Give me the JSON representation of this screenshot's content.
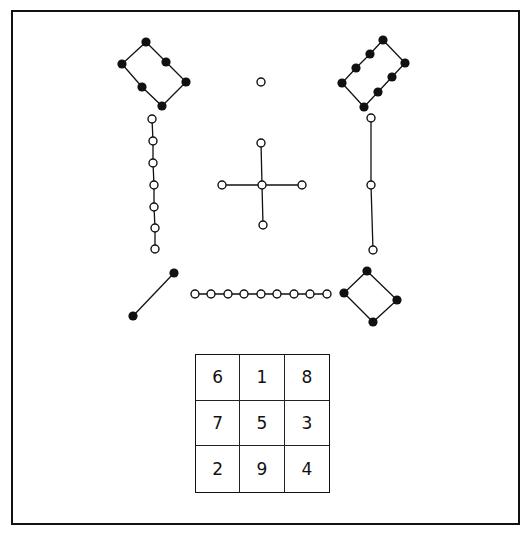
{
  "colors": {
    "ink": "#111111",
    "background": "#ffffff"
  },
  "figures": [
    {
      "name": "filled-loop-6",
      "kind": "closed",
      "fill": "filled",
      "points": [
        [
          146,
          42
        ],
        [
          166,
          62
        ],
        [
          186,
          82
        ],
        [
          162,
          106
        ],
        [
          142,
          87
        ],
        [
          122,
          64
        ]
      ]
    },
    {
      "name": "filled-loop-8",
      "kind": "closed",
      "fill": "filled",
      "points": [
        [
          383,
          40
        ],
        [
          405,
          63
        ],
        [
          392,
          77
        ],
        [
          378,
          92
        ],
        [
          364,
          107
        ],
        [
          342,
          83
        ],
        [
          356,
          68
        ],
        [
          370,
          54
        ]
      ]
    },
    {
      "name": "open-single-1",
      "kind": "open",
      "fill": "open",
      "points": [
        [
          261,
          82
        ]
      ]
    },
    {
      "name": "open-chain-7",
      "kind": "open",
      "fill": "open",
      "points": [
        [
          152,
          119
        ],
        [
          153,
          141
        ],
        [
          153,
          163
        ],
        [
          154,
          185
        ],
        [
          154,
          207
        ],
        [
          155,
          228
        ],
        [
          155,
          249
        ]
      ]
    },
    {
      "name": "open-chain-3",
      "kind": "open",
      "fill": "open",
      "points": [
        [
          371,
          118
        ],
        [
          371,
          185
        ],
        [
          373,
          250
        ]
      ]
    },
    {
      "name": "open-cross-5",
      "kind": "star",
      "fill": "open",
      "center": [
        262,
        185
      ],
      "points": [
        [
          261,
          143
        ],
        [
          222,
          185
        ],
        [
          302,
          185
        ],
        [
          263,
          225
        ]
      ]
    },
    {
      "name": "filled-pair-2",
      "kind": "open",
      "fill": "filled",
      "points": [
        [
          133,
          316
        ],
        [
          174,
          273
        ]
      ]
    },
    {
      "name": "open-chain-9",
      "kind": "open",
      "fill": "open",
      "points": [
        [
          195,
          294
        ],
        [
          211,
          294
        ],
        [
          228,
          294
        ],
        [
          244,
          294
        ],
        [
          261,
          294
        ],
        [
          277,
          294
        ],
        [
          294,
          294
        ],
        [
          310,
          294
        ],
        [
          327,
          294
        ]
      ]
    },
    {
      "name": "filled-loop-4",
      "kind": "closed",
      "fill": "filled",
      "points": [
        [
          367,
          271
        ],
        [
          397,
          300
        ],
        [
          373,
          322
        ],
        [
          344,
          293
        ]
      ]
    }
  ],
  "magic_square": {
    "rows": [
      [
        "6",
        "1",
        "8"
      ],
      [
        "7",
        "5",
        "3"
      ],
      [
        "2",
        "9",
        "4"
      ]
    ]
  }
}
